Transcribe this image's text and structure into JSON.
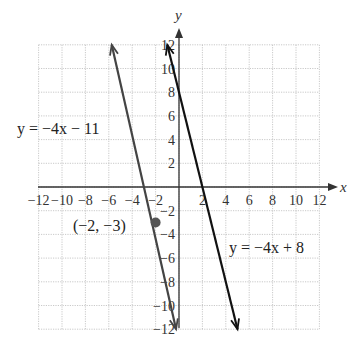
{
  "chart_data": {
    "type": "line",
    "title": "",
    "xlabel": "x",
    "ylabel": "y",
    "xlim": [
      -12,
      12
    ],
    "ylim": [
      -12,
      12
    ],
    "grid": true,
    "x_ticks": [
      "-12",
      "-10",
      "-8",
      "-6",
      "-4",
      "-2",
      "2",
      "4",
      "6",
      "8",
      "10",
      "12"
    ],
    "y_ticks": [
      "12",
      "10",
      "8",
      "6",
      "4",
      "2",
      "-2",
      "-4",
      "-6",
      "-8",
      "-10",
      "-12"
    ],
    "series": [
      {
        "name": "y = -4x - 11",
        "slope": -4,
        "intercept": -11,
        "x": [
          -5.75,
          -0.25
        ],
        "y": [
          12,
          -12
        ],
        "color": "#444444"
      },
      {
        "name": "y = -4x + 8",
        "slope": -4,
        "intercept": 8,
        "x": [
          -1,
          5
        ],
        "y": [
          12,
          -12
        ],
        "color": "#111111"
      }
    ],
    "points": [
      {
        "label": "(-2, -3)",
        "x": -2,
        "y": -3,
        "color": "#555555"
      }
    ],
    "annotations": [
      {
        "text": "y = -4x - 11",
        "near": "upper-left"
      },
      {
        "text": "y = -4x + 8",
        "near": "lower-right"
      },
      {
        "text": "(-2, -3)",
        "near": "point"
      }
    ]
  },
  "labels": {
    "x_axis": "x",
    "y_axis": "y",
    "eq1": "y = −4x − 11",
    "eq2": "y = −4x + 8",
    "point": "(−2, −3)"
  }
}
